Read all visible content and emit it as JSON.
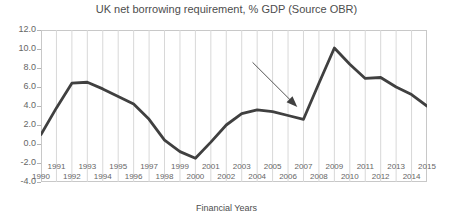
{
  "chart_data": {
    "type": "line",
    "title": "UK net borrowing requirement, % GDP (Source OBR)",
    "xlabel": "Financial Years",
    "ylabel": "",
    "xlim": [
      1990,
      2015
    ],
    "ylim": [
      -4.0,
      12.0
    ],
    "grid": "vertical",
    "legend": "none",
    "line_color": "#404040",
    "categories": [
      1990,
      1991,
      1992,
      1993,
      1994,
      1995,
      1996,
      1997,
      1998,
      1999,
      2000,
      2001,
      2002,
      2003,
      2004,
      2005,
      2006,
      2007,
      2008,
      2009,
      2010,
      2011,
      2012,
      2013,
      2014,
      2015
    ],
    "values": [
      1.0,
      3.8,
      6.4,
      6.5,
      5.8,
      5.0,
      4.2,
      2.6,
      0.4,
      -0.8,
      -1.5,
      0.2,
      2.0,
      3.2,
      3.6,
      3.4,
      3.0,
      2.6,
      6.4,
      10.1,
      8.4,
      6.9,
      7.0,
      6.0,
      5.2,
      4.0
    ],
    "xticks": [
      1990,
      1991,
      1992,
      1993,
      1994,
      1995,
      1996,
      1997,
      1998,
      1999,
      2000,
      2001,
      2002,
      2003,
      2004,
      2005,
      2006,
      2007,
      2008,
      2009,
      2010,
      2011,
      2012,
      2013,
      2014,
      2015
    ],
    "xtick_labels": [
      "1990",
      "1991",
      "1992",
      "1993",
      "1994",
      "1995",
      "1996",
      "1997",
      "1998",
      "1999",
      "2000",
      "2001",
      "2002",
      "2003",
      "2004",
      "2005",
      "2006",
      "2007",
      "2008",
      "2009",
      "2010",
      "2011",
      "2012",
      "2013",
      "2014",
      "2015"
    ],
    "yticks": [
      12.0,
      10.0,
      8.0,
      6.0,
      4.0,
      2.0,
      0.0,
      -2.0,
      -4.0
    ],
    "ytick_labels": [
      "12.0",
      "10.0",
      "8.0",
      "6.0",
      "4.0",
      "2.0",
      "0.0",
      "-2.0",
      "-4.0"
    ],
    "annotations": [
      {
        "name": "trough-pointer-arrow",
        "type": "arrow",
        "from": [
          2003.7,
          8.6
        ],
        "to": [
          2006.6,
          3.9
        ]
      }
    ]
  }
}
